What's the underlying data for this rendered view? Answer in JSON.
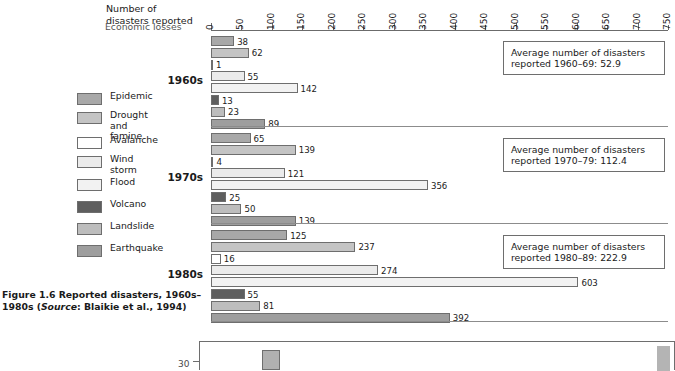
{
  "axis_title": "Number of\ndisasters reported",
  "caption": {
    "prefix": "Figure 1.6  Reported disasters,\n1960s–1980s (",
    "source_italic": "Source",
    "suffix": ": Blaikie et al.,\n1994)"
  },
  "legend": {
    "items": [
      {
        "label": "Epidemic",
        "color": "#a8a8a8"
      },
      {
        "label": "Drought and\nfamine",
        "color": "#c4c4c4"
      },
      {
        "label": "Avalanche",
        "color": "#ffffff"
      },
      {
        "label": "Wind storm",
        "color": "#ebebeb"
      },
      {
        "label": "Flood",
        "color": "#f2f2f2"
      },
      {
        "label": "Volcano",
        "color": "#5e5e5e"
      },
      {
        "label": "Landslide",
        "color": "#bdbdbd"
      },
      {
        "label": "Earthquake",
        "color": "#9e9e9e"
      }
    ]
  },
  "annotations": [
    {
      "text": "Average number of disasters\nreported 1960–69: 52.9"
    },
    {
      "text": "Average number of disasters\nreported 1970–79: 112.4"
    },
    {
      "text": "Average number of disasters\nreported 1980–89: 222.9"
    }
  ],
  "bottom_figure": {
    "legend_label": "Economic losses",
    "axis_label": "30"
  },
  "chart_data": {
    "type": "bar",
    "orientation": "horizontal",
    "title": "Figure 1.6 Reported disasters, 1960s–1980s",
    "xlabel": "Number of disasters reported",
    "ylabel": "",
    "xlim": [
      0,
      750
    ],
    "xticks": [
      0,
      50,
      100,
      150,
      200,
      250,
      300,
      350,
      400,
      450,
      500,
      550,
      600,
      650,
      700,
      750
    ],
    "grid": false,
    "legend_position": "left",
    "categories": [
      "Epidemic",
      "Drought and famine",
      "Avalanche",
      "Wind storm",
      "Flood",
      "Volcano",
      "Landslide",
      "Earthquake"
    ],
    "groups": [
      "1960s",
      "1970s",
      "1980s"
    ],
    "series": [
      {
        "name": "1960s",
        "values": [
          38,
          62,
          1,
          55,
          142,
          13,
          23,
          89
        ],
        "average": 52.9
      },
      {
        "name": "1970s",
        "values": [
          65,
          139,
          4,
          121,
          356,
          25,
          50,
          139
        ],
        "average": 112.4
      },
      {
        "name": "1980s",
        "values": [
          125,
          237,
          16,
          274,
          603,
          55,
          81,
          392
        ],
        "average": 222.9
      }
    ],
    "annotations": [
      "Average number of disasters reported 1960–69: 52.9",
      "Average number of disasters reported 1970–79: 112.4",
      "Average number of disasters reported 1980–89: 222.9"
    ]
  }
}
